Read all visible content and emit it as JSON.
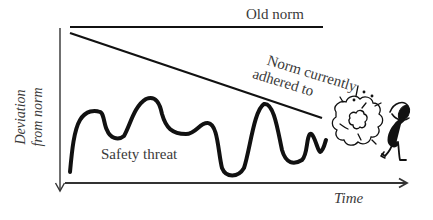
{
  "labels": {
    "old_norm": "Old norm",
    "current_norm_line1": "Norm currently",
    "current_norm_line2": "adhered to",
    "safety_threat": "Safety threat",
    "x_axis": "Time",
    "y_axis_line1": "Deviation",
    "y_axis_line2": "from norm"
  },
  "icons": {
    "explosion": "explosion-cloud-icon",
    "figure": "startled-person-icon"
  },
  "colors": {
    "line": "#111111",
    "axis": "#333333",
    "text": "#3a3a3a",
    "background": "#ffffff"
  }
}
